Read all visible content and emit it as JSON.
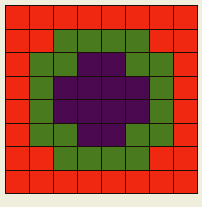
{
  "artwork": {
    "title": "Concentric Color Grid",
    "background_color": "#f0eedc",
    "grid_line_color": "#1a0f08",
    "columns": 8,
    "rows": 8
  },
  "palette": {
    "R": {
      "name": "red",
      "hex": "#f02811"
    },
    "G": {
      "name": "green",
      "hex": "#4a7a1e"
    },
    "P": {
      "name": "purple",
      "hex": "#4b0a50"
    }
  },
  "chart_data": {
    "type": "heatmap",
    "xlabel": "",
    "ylabel": "",
    "categories": [
      "c0",
      "c1",
      "c2",
      "c3",
      "c4",
      "c5",
      "c6",
      "c7"
    ],
    "row_labels": [
      "r0",
      "r1",
      "r2",
      "r3",
      "r4",
      "r5",
      "r6",
      "r7"
    ],
    "legend": [
      "red",
      "green",
      "purple"
    ],
    "color_map": {
      "R": "#f02811",
      "G": "#4a7a1e",
      "P": "#4b0a50"
    },
    "values": [
      [
        "R",
        "R",
        "R",
        "R",
        "R",
        "R",
        "R",
        "R"
      ],
      [
        "R",
        "R",
        "G",
        "G",
        "G",
        "G",
        "R",
        "R"
      ],
      [
        "R",
        "G",
        "G",
        "P",
        "P",
        "G",
        "G",
        "R"
      ],
      [
        "R",
        "G",
        "P",
        "P",
        "P",
        "P",
        "G",
        "R"
      ],
      [
        "R",
        "G",
        "P",
        "P",
        "P",
        "P",
        "G",
        "R"
      ],
      [
        "R",
        "G",
        "G",
        "P",
        "P",
        "G",
        "G",
        "R"
      ],
      [
        "R",
        "R",
        "G",
        "G",
        "G",
        "G",
        "R",
        "R"
      ],
      [
        "R",
        "R",
        "R",
        "R",
        "R",
        "R",
        "R",
        "R"
      ]
    ]
  }
}
